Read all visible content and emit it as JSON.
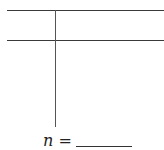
{
  "tchart": {
    "left_header": "",
    "right_header": "",
    "left_values": [],
    "right_values": []
  },
  "footer": {
    "variable": "n",
    "equals": " = ",
    "blank_value": ""
  }
}
